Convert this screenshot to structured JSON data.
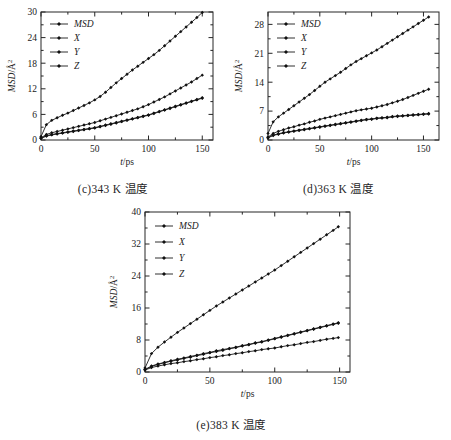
{
  "figure": {
    "panels": [
      {
        "id": "c",
        "caption": "(c)343 K 温度",
        "chart_data": {
          "type": "line",
          "title": "",
          "xlabel": "t/ps",
          "ylabel": "MSD/Å2",
          "xlim": [
            0,
            160
          ],
          "ylim": [
            0,
            30
          ],
          "xticks": [
            0,
            50,
            100,
            150
          ],
          "yticks": [
            0,
            6,
            12,
            18,
            24,
            30
          ],
          "grid": false,
          "legend_position": "top-left",
          "legend": [
            "MSD",
            "X",
            "Y",
            "Z"
          ],
          "x": [
            0,
            5,
            10,
            15,
            20,
            25,
            30,
            35,
            40,
            45,
            50,
            55,
            60,
            65,
            70,
            75,
            80,
            85,
            90,
            95,
            100,
            105,
            110,
            115,
            120,
            125,
            130,
            135,
            140,
            145,
            150
          ],
          "series": [
            {
              "name": "MSD",
              "values": [
                0.8,
                3.6,
                4.6,
                5.2,
                5.8,
                6.3,
                6.9,
                7.5,
                8.1,
                8.7,
                9.4,
                10.2,
                11.2,
                12.3,
                13.4,
                14.4,
                15.4,
                16.4,
                17.3,
                18.2,
                19.1,
                20.0,
                21.0,
                22.1,
                23.2,
                24.3,
                25.4,
                26.5,
                27.6,
                28.7,
                29.9
              ]
            },
            {
              "name": "X",
              "values": [
                0.5,
                1.3,
                1.7,
                2.0,
                2.3,
                2.6,
                2.9,
                3.2,
                3.5,
                3.8,
                4.1,
                4.5,
                4.9,
                5.3,
                5.7,
                6.1,
                6.5,
                6.9,
                7.3,
                7.8,
                8.3,
                8.9,
                9.5,
                10.1,
                10.8,
                11.5,
                12.2,
                12.9,
                13.6,
                14.4,
                15.2
              ]
            },
            {
              "name": "Y",
              "values": [
                0.4,
                1.0,
                1.3,
                1.5,
                1.7,
                1.9,
                2.1,
                2.3,
                2.5,
                2.7,
                2.9,
                3.2,
                3.5,
                3.8,
                4.1,
                4.4,
                4.7,
                5.0,
                5.3,
                5.6,
                5.9,
                6.3,
                6.7,
                7.1,
                7.5,
                7.9,
                8.3,
                8.7,
                9.1,
                9.5,
                9.9
              ]
            },
            {
              "name": "Z",
              "values": [
                0.4,
                0.9,
                1.2,
                1.4,
                1.6,
                1.8,
                2.0,
                2.2,
                2.4,
                2.6,
                2.8,
                3.1,
                3.4,
                3.7,
                4.0,
                4.3,
                4.6,
                4.9,
                5.2,
                5.5,
                5.8,
                6.2,
                6.6,
                7.0,
                7.4,
                7.8,
                8.2,
                8.6,
                9.0,
                9.4,
                9.8
              ]
            }
          ]
        }
      },
      {
        "id": "d",
        "caption": "(d)363 K 温度",
        "chart_data": {
          "type": "line",
          "title": "",
          "xlabel": "t/ps",
          "ylabel": "MSD/Å2",
          "xlim": [
            0,
            165
          ],
          "ylim": [
            0,
            31
          ],
          "xticks": [
            0,
            50,
            100,
            150
          ],
          "yticks": [
            0,
            7,
            14,
            21,
            28
          ],
          "grid": false,
          "legend_position": "top-left",
          "legend": [
            "MSD",
            "X",
            "Y",
            "Z"
          ],
          "x": [
            0,
            5,
            10,
            15,
            20,
            25,
            30,
            35,
            40,
            45,
            50,
            55,
            60,
            65,
            70,
            75,
            80,
            85,
            90,
            95,
            100,
            105,
            110,
            115,
            120,
            125,
            130,
            135,
            140,
            145,
            150,
            155
          ],
          "series": [
            {
              "name": "MSD",
              "values": [
                1.6,
                4.4,
                5.6,
                6.5,
                7.4,
                8.3,
                9.2,
                10.1,
                11.0,
                12.0,
                13.0,
                14.0,
                14.8,
                15.6,
                16.4,
                17.3,
                18.2,
                19.0,
                19.7,
                20.4,
                21.1,
                21.8,
                22.6,
                23.4,
                24.2,
                25.0,
                25.8,
                26.6,
                27.4,
                28.2,
                29.0,
                29.8
              ]
            },
            {
              "name": "X",
              "values": [
                0.7,
                1.6,
                2.1,
                2.5,
                2.9,
                3.2,
                3.6,
                3.9,
                4.3,
                4.6,
                5.0,
                5.3,
                5.6,
                5.9,
                6.2,
                6.5,
                6.8,
                7.1,
                7.3,
                7.5,
                7.7,
                8.0,
                8.3,
                8.6,
                9.0,
                9.4,
                9.8,
                10.3,
                10.8,
                11.3,
                11.8,
                12.3
              ]
            },
            {
              "name": "Y",
              "values": [
                0.6,
                1.2,
                1.5,
                1.8,
                2.0,
                2.2,
                2.4,
                2.6,
                2.8,
                3.0,
                3.2,
                3.4,
                3.6,
                3.8,
                4.0,
                4.2,
                4.4,
                4.6,
                4.8,
                5.0,
                5.1,
                5.3,
                5.4,
                5.5,
                5.7,
                5.8,
                5.9,
                6.0,
                6.1,
                6.2,
                6.3,
                6.4
              ]
            },
            {
              "name": "Z",
              "values": [
                0.5,
                1.1,
                1.4,
                1.7,
                1.9,
                2.1,
                2.3,
                2.5,
                2.7,
                2.9,
                3.1,
                3.3,
                3.5,
                3.7,
                3.9,
                4.1,
                4.3,
                4.5,
                4.7,
                4.9,
                5.0,
                5.2,
                5.3,
                5.4,
                5.6,
                5.7,
                5.8,
                5.9,
                6.0,
                6.1,
                6.2,
                6.3
              ]
            }
          ]
        }
      },
      {
        "id": "e",
        "caption": "(e)383 K 温度",
        "chart_data": {
          "type": "line",
          "title": "",
          "xlabel": "t/ps",
          "ylabel": "MSD/Å2",
          "xlim": [
            0,
            158
          ],
          "ylim": [
            0,
            40
          ],
          "xticks": [
            0,
            50,
            100,
            150
          ],
          "yticks": [
            0,
            8,
            16,
            24,
            32,
            40
          ],
          "grid": false,
          "legend_position": "top-left",
          "legend": [
            "MSD",
            "X",
            "Y",
            "Z"
          ],
          "x": [
            0,
            5,
            10,
            15,
            20,
            25,
            30,
            35,
            40,
            45,
            50,
            55,
            60,
            65,
            70,
            75,
            80,
            85,
            90,
            95,
            100,
            105,
            110,
            115,
            120,
            125,
            130,
            135,
            140,
            145,
            149
          ],
          "series": [
            {
              "name": "MSD",
              "values": [
                1.0,
                4.6,
                6.2,
                7.5,
                8.7,
                9.9,
                11.0,
                12.1,
                13.2,
                14.3,
                15.4,
                16.5,
                17.5,
                18.5,
                19.5,
                20.5,
                21.5,
                22.5,
                23.5,
                24.5,
                25.5,
                26.6,
                27.7,
                28.8,
                29.9,
                31.0,
                32.1,
                33.2,
                34.3,
                35.4,
                36.3
              ]
            },
            {
              "name": "X",
              "values": [
                0.6,
                1.5,
                2.0,
                2.4,
                2.8,
                3.2,
                3.5,
                3.9,
                4.2,
                4.6,
                4.9,
                5.3,
                5.6,
                5.9,
                6.2,
                6.6,
                6.9,
                7.3,
                7.6,
                8.0,
                8.4,
                8.8,
                9.2,
                9.6,
                10.0,
                10.4,
                10.8,
                11.2,
                11.6,
                12.0,
                12.3
              ]
            },
            {
              "name": "Y",
              "values": [
                0.6,
                1.4,
                1.9,
                2.3,
                2.7,
                3.0,
                3.4,
                3.7,
                4.1,
                4.4,
                4.8,
                5.1,
                5.4,
                5.8,
                6.1,
                6.5,
                6.8,
                7.2,
                7.5,
                7.9,
                8.3,
                8.7,
                9.1,
                9.5,
                9.9,
                10.3,
                10.7,
                11.1,
                11.5,
                11.9,
                12.2
              ]
            },
            {
              "name": "Z",
              "values": [
                0.5,
                1.1,
                1.5,
                1.8,
                2.1,
                2.3,
                2.6,
                2.8,
                3.1,
                3.3,
                3.6,
                3.8,
                4.1,
                4.3,
                4.6,
                4.8,
                5.1,
                5.3,
                5.6,
                5.8,
                6.0,
                6.3,
                6.6,
                6.8,
                7.1,
                7.4,
                7.6,
                7.9,
                8.2,
                8.4,
                8.6
              ]
            }
          ]
        }
      }
    ]
  }
}
